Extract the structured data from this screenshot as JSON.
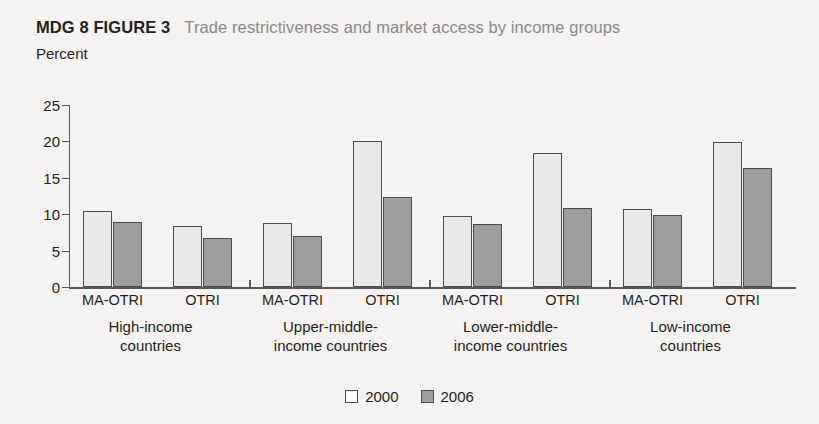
{
  "header": {
    "figure_tag": "MDG 8 FIGURE 3",
    "title": "Trade restrictiveness and market access by income groups"
  },
  "axis_unit_label": "Percent",
  "legend": {
    "items": [
      {
        "label": "2000",
        "color": "#ffffff",
        "swatch_name": "legend-swatch-2000"
      },
      {
        "label": "2006",
        "color": "#9d9d9b",
        "swatch_name": "legend-swatch-2006"
      }
    ]
  },
  "chart_data": {
    "type": "bar",
    "title": "Trade restrictiveness and market access by income groups",
    "subtitle": "MDG 8 FIGURE 3",
    "xlabel": "",
    "ylabel": "Percent",
    "ylim": [
      0,
      25
    ],
    "yticks": [
      0,
      5,
      10,
      15,
      20,
      25
    ],
    "ytick_labels": [
      "0",
      "5",
      "10",
      "15",
      "20",
      "25"
    ],
    "grid": false,
    "legend_position": "bottom-center",
    "categories": [
      "High-income countries MA-OTRI",
      "High-income countries OTRI",
      "Upper-middle-income countries MA-OTRI",
      "Upper-middle-income countries OTRI",
      "Lower-middle-income countries MA-OTRI",
      "Lower-middle-income countries OTRI",
      "Low-income countries MA-OTRI",
      "Low-income countries OTRI"
    ],
    "series": [
      {
        "name": "2000",
        "color": "#e9e9e7",
        "values": [
          10.4,
          8.4,
          8.8,
          20.0,
          9.8,
          18.4,
          10.7,
          19.9
        ]
      },
      {
        "name": "2006",
        "color": "#9d9d9b",
        "values": [
          8.9,
          6.7,
          7.0,
          12.4,
          8.7,
          10.8,
          9.9,
          16.4
        ]
      }
    ],
    "groups": [
      {
        "group_label_line1": "High-income",
        "group_label_line2": "countries",
        "measures": [
          {
            "label": "MA-OTRI",
            "v2000": 10.4,
            "v2006": 8.9
          },
          {
            "label": "OTRI",
            "v2000": 8.4,
            "v2006": 6.7
          }
        ]
      },
      {
        "group_label_line1": "Upper-middle-",
        "group_label_line2": "income countries",
        "measures": [
          {
            "label": "MA-OTRI",
            "v2000": 8.8,
            "v2006": 7.0
          },
          {
            "label": "OTRI",
            "v2000": 20.0,
            "v2006": 12.4
          }
        ]
      },
      {
        "group_label_line1": "Lower-middle-",
        "group_label_line2": "income countries",
        "measures": [
          {
            "label": "MA-OTRI",
            "v2000": 9.8,
            "v2006": 8.7
          },
          {
            "label": "OTRI",
            "v2000": 18.4,
            "v2006": 10.8
          }
        ]
      },
      {
        "group_label_line1": "Low-income",
        "group_label_line2": "countries",
        "measures": [
          {
            "label": "MA-OTRI",
            "v2000": 10.7,
            "v2006": 9.9
          },
          {
            "label": "OTRI",
            "v2000": 19.9,
            "v2006": 16.4
          }
        ]
      }
    ]
  },
  "layout": {
    "group_left_px": [
      14,
      194,
      374,
      554
    ],
    "pair_offset_px": [
      0,
      90
    ],
    "sep_tick_px": [
      180,
      360,
      540
    ]
  }
}
